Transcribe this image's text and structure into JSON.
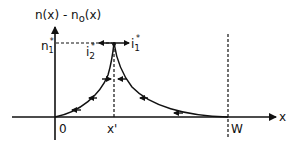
{
  "diagram": {
    "y_axis_label": "n(x) - n",
    "y_axis_label_sub": "o",
    "y_axis_label_tail": "(x)",
    "x_axis_label": "x",
    "peak_value_label": "n",
    "peak_value_sub": "1",
    "peak_value_sup": "*",
    "current_left_label": "i",
    "current_left_sub": "2",
    "current_left_sup": "*",
    "current_right_label": "i",
    "current_right_sub": "1",
    "current_right_sup": "*",
    "origin_label": "0",
    "peak_position_label": "x'",
    "boundary_label": "W",
    "colors": {
      "line": "#111111",
      "background": "#ffffff"
    }
  }
}
